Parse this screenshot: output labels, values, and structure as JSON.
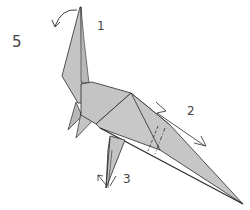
{
  "diagram": {
    "type": "origami-step",
    "step_number": "5",
    "labels": {
      "one": "1",
      "two": "2",
      "three": "3"
    },
    "colors": {
      "paper": "#c4c4c4",
      "paper_dark": "#a9a9a9",
      "line": "#2a2a2a",
      "background": "#ffffff"
    },
    "annotations": [
      {
        "id": "1",
        "description": "fold head down (curved arrow at top of neck)"
      },
      {
        "id": "2",
        "description": "crimp/pleat tail (zigzag arrow with dashed fold lines)"
      },
      {
        "id": "3",
        "description": "reverse-fold foot (arrows at foot)"
      }
    ]
  }
}
